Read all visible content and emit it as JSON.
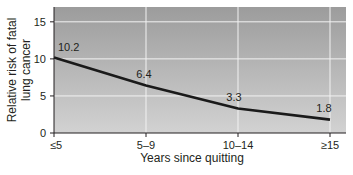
{
  "chart_data": {
    "type": "line",
    "title": "",
    "xlabel": "Years since quitting",
    "ylabel": "Relative risk of fatal lung cancer",
    "ylabel_lines": [
      "Relative risk of fatal",
      "lung cancer"
    ],
    "categories": [
      "≤5",
      "5–9",
      "10–14",
      "≥15"
    ],
    "series": [
      {
        "name": "Relative risk",
        "values": [
          10.2,
          6.4,
          3.3,
          1.8
        ],
        "color": "#1a1a1a"
      }
    ],
    "data_labels": [
      "10.2",
      "6.4",
      "3.3",
      "1.8"
    ],
    "yticks": [
      0,
      5,
      10,
      15
    ],
    "ylim": [
      0,
      17
    ],
    "grid": true,
    "legend": "none",
    "plot_gradient": {
      "top": "#9a9a9a",
      "bottom": "#d4d4d4"
    }
  }
}
